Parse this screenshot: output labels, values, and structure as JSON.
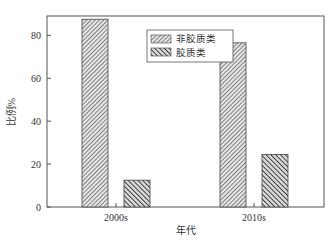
{
  "chart_data": {
    "type": "bar",
    "title": "",
    "xlabel": "年代",
    "ylabel": "比例%",
    "categories": [
      "2000s",
      "2010s"
    ],
    "series": [
      {
        "name": "非胶质类",
        "values": [
          87.5,
          76.5
        ],
        "pattern": "fine-hatch"
      },
      {
        "name": "胶质类",
        "values": [
          12.5,
          24.5
        ],
        "pattern": "coarse-hatch"
      }
    ],
    "ylim": [
      0,
      89
    ],
    "yticks": [
      0,
      20,
      40,
      60,
      80
    ],
    "grid": false,
    "legend_position": "upper-center-inside"
  },
  "colors": {
    "axis": "#555555",
    "bar_fill": "#bdbdbd",
    "hatch": "#444444",
    "text": "#333333"
  }
}
